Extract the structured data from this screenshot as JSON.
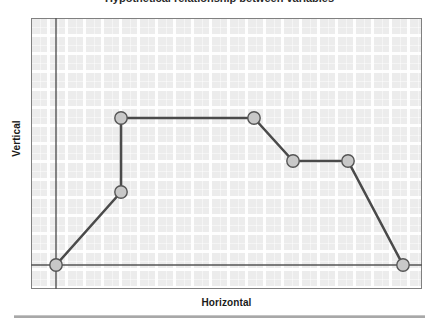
{
  "figure": {
    "title_remnant": "Hypothetical relationship between variables",
    "bottom_rule": "horizontal-rule"
  },
  "chart_data": {
    "type": "line",
    "title": "",
    "xlabel": "Horizontal",
    "ylabel": "Vertical",
    "grid": true,
    "legend": "none",
    "xlim": [
      0,
      100
    ],
    "ylim": [
      0,
      100
    ],
    "axis_tick_labels": {
      "x": [],
      "y": []
    },
    "series": [
      {
        "name": "series-1",
        "marker": "circle",
        "line_color": "#4a4a4a",
        "marker_fill": "#c8c8c8",
        "marker_edge": "#555555",
        "x": [
          7,
          26,
          26,
          59,
          70,
          85,
          100
        ],
        "y": [
          0,
          36,
          65,
          65,
          49,
          49,
          0
        ]
      }
    ],
    "reference_lines": {
      "vertical_axis_x": 7,
      "horizontal_baseline_y": 0
    },
    "pixel_points": [
      {
        "x": 25,
        "y": 247
      },
      {
        "x": 90,
        "y": 174
      },
      {
        "x": 90,
        "y": 100
      },
      {
        "x": 223,
        "y": 100
      },
      {
        "x": 262,
        "y": 143
      },
      {
        "x": 317,
        "y": 143
      },
      {
        "x": 372,
        "y": 247
      }
    ]
  },
  "colors": {
    "plot_background": "#ececec",
    "grid_line": "#ffffff",
    "plot_border": "#808080",
    "axis_line": "#555555",
    "data_line": "#4a4a4a",
    "marker_fill": "#c8c8c8",
    "marker_edge": "#555555",
    "label_text": "#1a1a1a",
    "rule": "#a8a8a8"
  }
}
